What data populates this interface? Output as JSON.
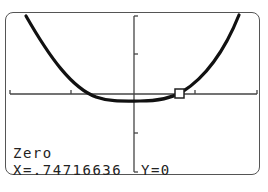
{
  "screen": {
    "mode_label": "Zero",
    "x_readout": "X=.74716636",
    "y_readout": "Y=0"
  },
  "graph": {
    "function_shape": "quartic-like upward curve with flat minimum slightly below x-axis",
    "cursor": {
      "type": "square-marker",
      "x": 0.74716636,
      "y": 0
    },
    "axes": {
      "x_ticks": 2,
      "y_ticks": 2
    },
    "colors": {
      "curve": "#111111",
      "axes": "#444444",
      "frame": "#555555",
      "background": "#ffffff"
    }
  }
}
